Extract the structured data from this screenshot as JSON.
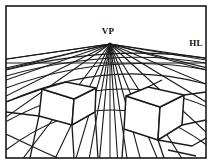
{
  "figure": {
    "background_color": "#ffffff",
    "line_color": "#1a1a1a",
    "frame": {
      "x": 6,
      "y": 6,
      "width": 200,
      "height": 152,
      "stroke_width": 1.6
    },
    "labels": {
      "vanishing_point": "VP",
      "horizon_line": "HL"
    },
    "label_positions": {
      "vanishing_point": {
        "x": 108,
        "y": 34
      },
      "horizon_line": {
        "x": 196,
        "y": 46
      }
    },
    "vanishing_point": {
      "x": 110,
      "y": 44
    },
    "horizon_line": {
      "y": 63,
      "x_start": 6,
      "x_end": 206,
      "stroke_width": 1.0
    },
    "center_vertical": {
      "x": 110,
      "y_start": 44,
      "y_end": 158,
      "stroke_width": 1.0
    },
    "rays": [
      {
        "name": "ray-far-left-1",
        "x2": -40,
        "y2": 66
      },
      {
        "name": "ray-far-left-2",
        "x2": -30,
        "y2": 78
      },
      {
        "name": "ray-left-1",
        "x2": 6,
        "y2": 59
      },
      {
        "name": "ray-left-2",
        "x2": 6,
        "y2": 68
      },
      {
        "name": "ray-left-3",
        "x2": 6,
        "y2": 80
      },
      {
        "name": "ray-left-4",
        "x2": 6,
        "y2": 96
      },
      {
        "name": "ray-left-5",
        "x2": 2,
        "y2": 120
      },
      {
        "name": "ray-left-6",
        "x2": 18,
        "y2": 165
      },
      {
        "name": "ray-left-7",
        "x2": 52,
        "y2": 165
      },
      {
        "name": "ray-left-8",
        "x2": 74,
        "y2": 165
      },
      {
        "name": "ray-left-9",
        "x2": 88,
        "y2": 165
      },
      {
        "name": "ray-center-left",
        "x2": 99,
        "y2": 165
      },
      {
        "name": "ray-center-right",
        "x2": 118,
        "y2": 165
      },
      {
        "name": "ray-right-1",
        "x2": 128,
        "y2": 165
      },
      {
        "name": "ray-right-2",
        "x2": 142,
        "y2": 165
      },
      {
        "name": "ray-right-3",
        "x2": 160,
        "y2": 165
      },
      {
        "name": "ray-right-4",
        "x2": 186,
        "y2": 165
      },
      {
        "name": "ray-right-5",
        "x2": 206,
        "y2": 132
      },
      {
        "name": "ray-right-6",
        "x2": 206,
        "y2": 102
      },
      {
        "name": "ray-right-7",
        "x2": 206,
        "y2": 84
      },
      {
        "name": "ray-right-8",
        "x2": 206,
        "y2": 70
      },
      {
        "name": "ray-right-9",
        "x2": 206,
        "y2": 60
      },
      {
        "name": "ray-far-right-1",
        "x2": 244,
        "y2": 64
      },
      {
        "name": "ray-far-right-2",
        "x2": 240,
        "y2": 76
      }
    ],
    "ground_arcs": [
      {
        "name": "arc-1",
        "d": "M 6 70 Q 110 44 206 58"
      },
      {
        "name": "arc-2",
        "d": "M 6 76 Q 110 47 206 63"
      },
      {
        "name": "arc-3",
        "d": "M 6 88 Q 110 50 213 71"
      },
      {
        "name": "arc-4",
        "d": "M 4 103 Q 110 55 213 86"
      },
      {
        "name": "arc-5",
        "d": "M 2 124 Q 110 62 214 110"
      },
      {
        "name": "arc-6",
        "d": "M 6 150 Q 110 72 208 146"
      }
    ],
    "boxes": [
      {
        "name": "box-left",
        "top_face": "M 42 89 L 66 82 L 96 88 L 74 99 Z",
        "front_face": "M 42 89 L 74 99 L 72 125 L 39 116 Z",
        "side_face": "M 74 99 L 96 88 L 95 112 L 72 125 Z"
      },
      {
        "name": "box-right",
        "top_face": "M 126 96 L 148 87 L 184 95 L 160 107 Z",
        "front_face": "M 126 96 L 160 107 L 158 140 L 124 129 Z",
        "side_face": "M 160 107 L 184 95 L 182 125 L 158 140 Z"
      }
    ],
    "ground_edges": [
      {
        "name": "ground-edge-1",
        "d": "M 6 102 L 42 89"
      },
      {
        "name": "ground-edge-2",
        "d": "M 6 112 L 39 116"
      },
      {
        "name": "ground-edge-3",
        "d": "M 39 116 L 30 158"
      },
      {
        "name": "ground-edge-4",
        "d": "M 72 125 L 74 158"
      },
      {
        "name": "ground-edge-5",
        "d": "M 6 134 L 44 152"
      },
      {
        "name": "ground-edge-6",
        "d": "M 44 152 L 58 158"
      },
      {
        "name": "ground-edge-7",
        "d": "M 95 112 L 98 158"
      },
      {
        "name": "ground-edge-8",
        "d": "M 124 129 L 122 158"
      },
      {
        "name": "ground-edge-9",
        "d": "M 158 140 L 164 158"
      },
      {
        "name": "ground-edge-10",
        "d": "M 182 125 L 206 120"
      },
      {
        "name": "ground-edge-11",
        "d": "M 158 140 L 192 146 L 206 138"
      },
      {
        "name": "ground-edge-12",
        "d": "M 168 150 L 196 156"
      },
      {
        "name": "ground-edge-13",
        "d": "M 184 95 L 206 92"
      },
      {
        "name": "ground-edge-14",
        "d": "M 148 87 L 162 80"
      }
    ]
  }
}
